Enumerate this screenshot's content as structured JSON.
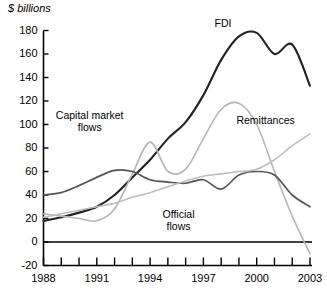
{
  "chart_data": {
    "type": "line",
    "title": "",
    "ylabel": "$ billions",
    "xlabel": "",
    "ylim": [
      -20,
      180
    ],
    "xlim": [
      1988,
      2003
    ],
    "grid": false,
    "legend_position": "inline-annotations",
    "y_ticks": [
      180,
      160,
      140,
      120,
      100,
      80,
      60,
      40,
      20,
      0,
      -20
    ],
    "x_ticks": [
      1988,
      1989,
      1990,
      1991,
      1992,
      1993,
      1994,
      1995,
      1996,
      1997,
      1998,
      1999,
      2000,
      2001,
      2002,
      2003
    ],
    "x_tick_labels": [
      "1988",
      "",
      "",
      "1991",
      "",
      "",
      "1994",
      "",
      "",
      "1997",
      "",
      "",
      "2000",
      "",
      "",
      "2003"
    ],
    "x": [
      1988,
      1989,
      1990,
      1991,
      1992,
      1993,
      1994,
      1995,
      1996,
      1997,
      1998,
      1999,
      2000,
      2001,
      2002,
      2003
    ],
    "series": [
      {
        "name": "FDI",
        "color": "#222222",
        "width": 2.1,
        "label_x": 1998.1,
        "label_y": 186,
        "values": [
          18,
          21,
          25,
          30,
          40,
          55,
          70,
          88,
          102,
          125,
          155,
          175,
          178,
          160,
          168,
          133
        ]
      },
      {
        "name": "Capital market flows",
        "color": "#b5b5b5",
        "width": 1.6,
        "label_x": 1990.6,
        "label_y": 108,
        "values": [
          24,
          22,
          20,
          18,
          28,
          58,
          85,
          60,
          62,
          88,
          113,
          118,
          100,
          60,
          22,
          -10
        ]
      },
      {
        "name": "Official flows",
        "color": "#555555",
        "width": 1.7,
        "label_x": 1995.6,
        "label_y": 24,
        "values": [
          40,
          42,
          48,
          55,
          61,
          60,
          53,
          51,
          50,
          53,
          45,
          57,
          60,
          57,
          40,
          30
        ]
      },
      {
        "name": "Remittances",
        "color": "#bdbdbd",
        "width": 1.6,
        "label_x": 2000.5,
        "label_y": 104,
        "values": [
          21,
          24,
          27,
          30,
          33,
          38,
          42,
          47,
          52,
          56,
          58,
          60,
          62,
          70,
          82,
          92
        ]
      }
    ]
  },
  "labels": {
    "y_axis_title": "$ billions",
    "fdi": "FDI",
    "capital_market_line1": "Capital market",
    "capital_market_line2": "flows",
    "official_line1": "Official",
    "official_line2": "flows",
    "remittances": "Remittances"
  }
}
